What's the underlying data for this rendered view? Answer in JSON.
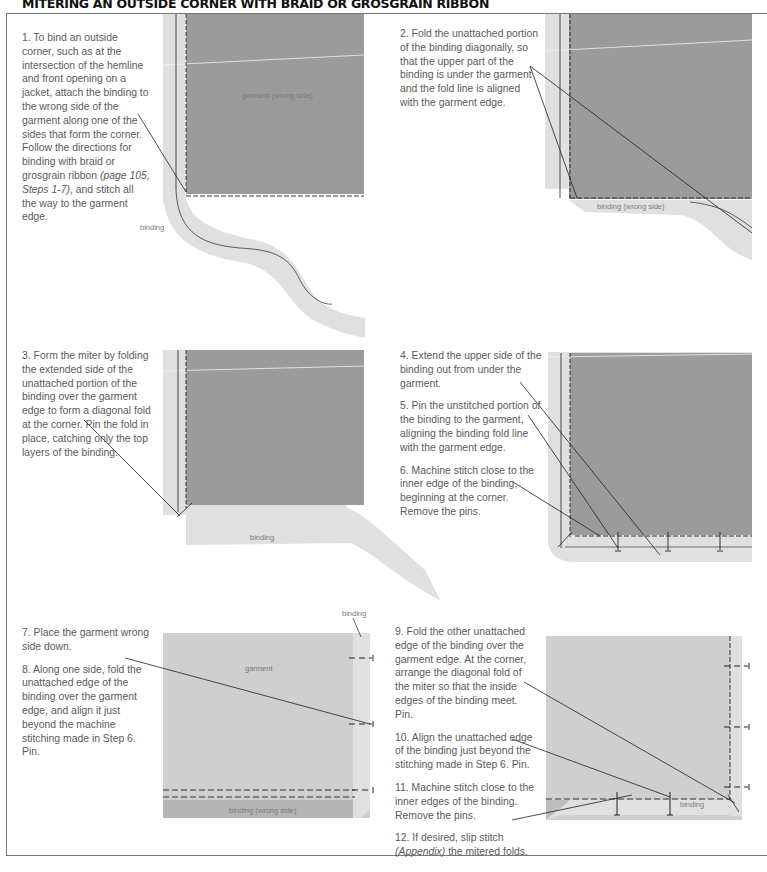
{
  "page": {
    "title": "MITERING AN OUTSIDE CORNER WITH BRAID OR GROSGRAIN RIBBON"
  },
  "panels": [
    {
      "id": "panel-1",
      "steps": [
        {
          "number": "1.",
          "text_before": " To bind an outside corner, such as at the intersection of the hemline and front opening on a jacket, attach the binding to the wrong side of the garment along one of the sides that form the corner. Follow the directions for binding with braid or grosgrain ribbon ",
          "italic": "(page 105, Steps 1-7)",
          "text_after": ", and stitch all the way to the garment edge."
        }
      ],
      "labels": {
        "garment": "garment (wrong side)",
        "binding": "binding"
      }
    },
    {
      "id": "panel-2",
      "steps": [
        {
          "number": "2.",
          "text": " Fold the unattached portion of the binding diagonally, so that the upper part of the binding is under the garment and the fold line is aligned with the garment edge."
        }
      ],
      "labels": {
        "binding": "binding (wrong side)"
      }
    },
    {
      "id": "panel-3",
      "steps": [
        {
          "number": "3.",
          "text": " Form the miter by folding the extended side of the unattached portion of the binding over the garment edge to form a diagonal fold at the corner. Pin the fold in place, catching only the top layers of the binding."
        }
      ],
      "labels": {
        "binding": "binding"
      }
    },
    {
      "id": "panel-4",
      "steps": [
        {
          "number": "4.",
          "text": " Extend the upper side of the binding out from under the garment."
        },
        {
          "number": "5.",
          "text": " Pin the unstitched portion of the binding to the garment, aligning the binding fold line with the garment edge."
        },
        {
          "number": "6.",
          "text": " Machine stitch close to the inner edge of the binding, beginning at the corner. Remove the pins."
        }
      ]
    },
    {
      "id": "panel-5",
      "steps": [
        {
          "number": "7.",
          "text": " Place the garment wrong side down."
        },
        {
          "number": "8.",
          "text": " Along one side, fold the unattached edge of the binding over the garment edge, and align it just beyond the machine stitching made in Step 6. Pin."
        }
      ],
      "labels": {
        "garment": "garment",
        "binding_top": "binding",
        "binding_bottom": "binding (wrong side)"
      }
    },
    {
      "id": "panel-6",
      "steps": [
        {
          "number": "9.",
          "text": " Fold the other unattached edge of the binding over the garment edge. At the corner, arrange the diagonal fold of the miter so that the inside edges of the binding meet. Pin."
        },
        {
          "number": "10.",
          "text": " Align the unattached edge of the binding just beyond the stitching made in Step 6. Pin."
        },
        {
          "number": "11.",
          "text": " Machine stitch close to the inner edges of the binding. Remove the pins."
        },
        {
          "number": "12.",
          "text_before": " If desired, slip stitch ",
          "italic": "(Appendix)",
          "text_after": " the mitered folds."
        }
      ],
      "labels": {
        "binding": "binding"
      }
    }
  ],
  "colors": {
    "garment_dark": "#9b9b9b",
    "garment_light": "#cfcfcf",
    "binding": "#e0e0e0",
    "text": "#5a5a5a",
    "line": "#333333"
  }
}
